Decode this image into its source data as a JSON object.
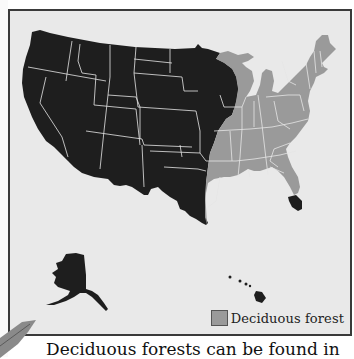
{
  "map": {
    "title": "",
    "region": "United States",
    "legend": {
      "items": [
        {
          "label": "Deciduous forest",
          "color": "#9a9a9a"
        }
      ]
    },
    "colors": {
      "deciduous": "#9a9a9a",
      "other": "#1e1e1e",
      "background": "#e9e9e9",
      "border": "#3a3a3a",
      "state_lines": "#e6e6e6"
    }
  },
  "caption": {
    "text": "Deciduous forests can be found in"
  },
  "decor": {
    "leaf_icon": "leaf-icon"
  }
}
